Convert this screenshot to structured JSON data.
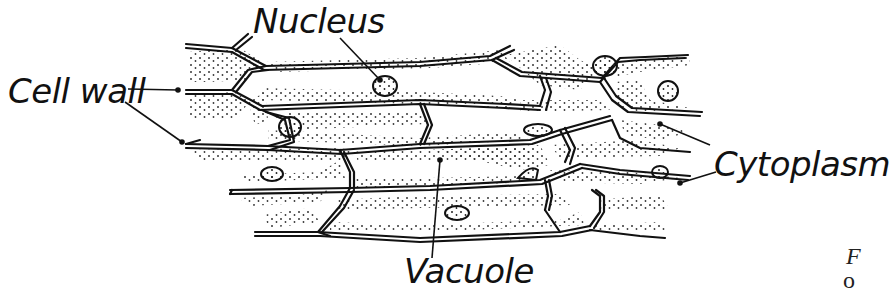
{
  "diagram": {
    "labels": {
      "nucleus": "Nucleus",
      "cell_wall": "Cell wall",
      "cytoplasm": "Cytoplasm",
      "vacuole": "Vacuole"
    },
    "caption_fragment": {
      "line1": "F",
      "line2": "o"
    },
    "colors": {
      "ink": "#111111",
      "background": "#ffffff"
    }
  }
}
